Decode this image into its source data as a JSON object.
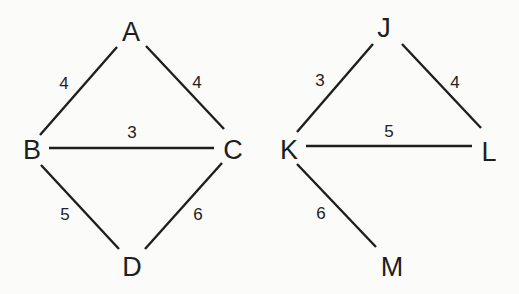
{
  "graphs": [
    {
      "name": "graph-1",
      "nodes": [
        {
          "id": "A",
          "label": "A",
          "x": 131,
          "y": 32
        },
        {
          "id": "B",
          "label": "B",
          "x": 32,
          "y": 150
        },
        {
          "id": "C",
          "label": "C",
          "x": 233,
          "y": 150
        },
        {
          "id": "D",
          "label": "D",
          "x": 132,
          "y": 267
        }
      ],
      "edges": [
        {
          "from": "A",
          "to": "B",
          "weight": "4",
          "x1": 117,
          "y1": 47,
          "x2": 40,
          "y2": 135,
          "lx": 64,
          "ly": 83
        },
        {
          "from": "A",
          "to": "C",
          "weight": "4",
          "x1": 146,
          "y1": 46,
          "x2": 224,
          "y2": 129,
          "lx": 197,
          "ly": 82
        },
        {
          "from": "B",
          "to": "C",
          "weight": "3",
          "x1": 49,
          "y1": 148,
          "x2": 214,
          "y2": 148,
          "lx": 132,
          "ly": 132
        },
        {
          "from": "B",
          "to": "D",
          "weight": "5",
          "x1": 41,
          "y1": 165,
          "x2": 119,
          "y2": 249,
          "lx": 65,
          "ly": 214
        },
        {
          "from": "C",
          "to": "D",
          "weight": "6",
          "x1": 222,
          "y1": 163,
          "x2": 145,
          "y2": 249,
          "lx": 198,
          "ly": 214
        }
      ]
    },
    {
      "name": "graph-2",
      "nodes": [
        {
          "id": "J",
          "label": "J",
          "x": 384,
          "y": 28
        },
        {
          "id": "K",
          "label": "K",
          "x": 289,
          "y": 150
        },
        {
          "id": "L",
          "label": "L",
          "x": 489,
          "y": 152
        },
        {
          "id": "M",
          "label": "M",
          "x": 392,
          "y": 267
        }
      ],
      "edges": [
        {
          "from": "J",
          "to": "K",
          "weight": "3",
          "x1": 373,
          "y1": 44,
          "x2": 297,
          "y2": 132,
          "lx": 320,
          "ly": 80
        },
        {
          "from": "J",
          "to": "L",
          "weight": "4",
          "x1": 402,
          "y1": 44,
          "x2": 481,
          "y2": 128,
          "lx": 455,
          "ly": 82
        },
        {
          "from": "K",
          "to": "L",
          "weight": "5",
          "x1": 306,
          "y1": 146,
          "x2": 472,
          "y2": 146,
          "lx": 389,
          "ly": 131
        },
        {
          "from": "K",
          "to": "M",
          "weight": "6",
          "x1": 297,
          "y1": 164,
          "x2": 376,
          "y2": 247,
          "lx": 321,
          "ly": 213
        }
      ]
    }
  ],
  "colors": {
    "background": "#fbfbfa",
    "stroke": "#1e1e1e",
    "text": "#1e1e1e"
  }
}
